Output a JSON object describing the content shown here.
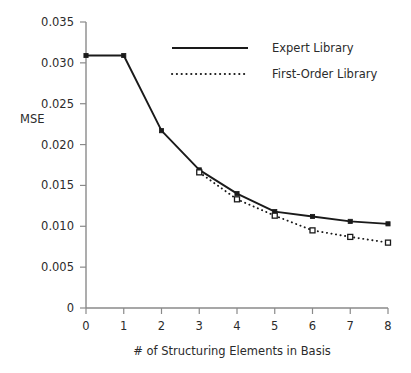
{
  "chart_data": {
    "type": "line",
    "title": "",
    "xlabel": "# of Structuring Elements in Basis",
    "ylabel": "MSE",
    "x": [
      0,
      1,
      2,
      3,
      4,
      5,
      6,
      7,
      8
    ],
    "xlim": [
      0,
      8
    ],
    "ylim": [
      0,
      0.035
    ],
    "grid": false,
    "legend_position": "top-center",
    "x_tick_labels": [
      "0",
      "1",
      "2",
      "3",
      "4",
      "5",
      "6",
      "7",
      "8"
    ],
    "y_tick_labels": [
      "0",
      "0.005",
      "0.010",
      "0.015",
      "0.020",
      "0.025",
      "0.030",
      "0.035"
    ],
    "y_tick_values": [
      0,
      0.005,
      0.01,
      0.015,
      0.02,
      0.025,
      0.03,
      0.035
    ],
    "series": [
      {
        "name": "Expert Library",
        "style": "solid",
        "marker": "filled-square",
        "x": [
          0,
          1,
          2,
          3,
          4,
          5,
          6,
          7,
          8
        ],
        "values": [
          0.0309,
          0.0309,
          0.0217,
          0.0169,
          0.014,
          0.0118,
          0.0112,
          0.0106,
          0.0103
        ]
      },
      {
        "name": "First-Order Library",
        "style": "dotted",
        "marker": "open-square",
        "x": [
          3,
          4,
          5,
          6,
          7,
          8
        ],
        "values": [
          0.0166,
          0.0133,
          0.0113,
          0.0095,
          0.0087,
          0.008
        ]
      }
    ]
  },
  "legend": {
    "entries": [
      {
        "label": "Expert Library",
        "style": "solid"
      },
      {
        "label": "First-Order Library",
        "style": "dotted"
      }
    ]
  },
  "colors": {
    "line": "#1a1a1a",
    "axis": "#8a8a8a",
    "text": "#2b2b2b",
    "background": "#ffffff"
  }
}
